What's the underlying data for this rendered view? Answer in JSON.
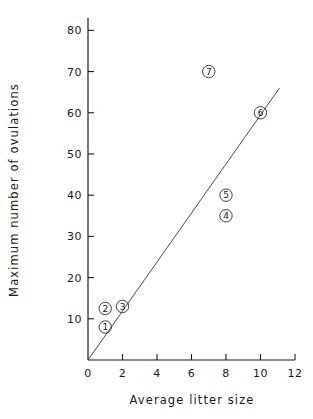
{
  "chart_data": {
    "type": "scatter",
    "title": "",
    "xlabel": "Average litter size",
    "ylabel": "Maximum number of ovulations",
    "xlim": [
      0,
      12
    ],
    "ylim": [
      0,
      83
    ],
    "grid": false,
    "legend": "none",
    "xticks": [
      "0",
      "2",
      "4",
      "6",
      "8",
      "10",
      "12"
    ],
    "xtick_values": [
      0,
      2,
      4,
      6,
      8,
      10,
      12
    ],
    "yticks": [
      "10",
      "20",
      "30",
      "40",
      "50",
      "60",
      "70",
      "80"
    ],
    "ytick_values": [
      10,
      20,
      30,
      40,
      50,
      60,
      70,
      80
    ],
    "points": [
      {
        "label": "1",
        "x": 1,
        "y": 8
      },
      {
        "label": "2",
        "x": 1,
        "y": 12.5
      },
      {
        "label": "3",
        "x": 2,
        "y": 13
      },
      {
        "label": "4",
        "x": 8,
        "y": 35
      },
      {
        "label": "5",
        "x": 8,
        "y": 40
      },
      {
        "label": "6",
        "x": 10,
        "y": 60
      },
      {
        "label": "7",
        "x": 7,
        "y": 70
      }
    ],
    "series": [
      {
        "name": "regression line",
        "type": "line",
        "x": [
          0,
          11.1
        ],
        "values": [
          0,
          66
        ]
      }
    ],
    "annotations": []
  },
  "colors": {
    "axis": "#1a1a1a",
    "marker": "#2b2b2b",
    "line": "#3a3a3a",
    "background": "#ffffff"
  }
}
